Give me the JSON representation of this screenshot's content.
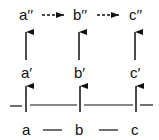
{
  "diagram": {
    "top_row": {
      "nodes": [
        {
          "id": "a2",
          "label": "a′′"
        },
        {
          "id": "b2",
          "label": "b′′"
        },
        {
          "id": "c2",
          "label": "c′′"
        }
      ],
      "edges": [
        {
          "from": "a2",
          "to": "b2",
          "style": "dashed-arrow"
        },
        {
          "from": "b2",
          "to": "c2",
          "style": "dashed-arrow"
        }
      ]
    },
    "middle_row": {
      "nodes": [
        {
          "id": "a1",
          "label": "a′"
        },
        {
          "id": "b1",
          "label": "b′"
        },
        {
          "id": "c1",
          "label": "c′"
        }
      ]
    },
    "bottom_row": {
      "nodes": [
        {
          "id": "a",
          "label": "a"
        },
        {
          "id": "b",
          "label": "b"
        },
        {
          "id": "c",
          "label": "c"
        }
      ],
      "edges": [
        {
          "from": "a",
          "to": "b",
          "style": "line"
        },
        {
          "from": "b",
          "to": "c",
          "style": "line"
        }
      ]
    },
    "vertical_edges": [
      {
        "from": "a1",
        "to": "a2",
        "style": "solid-arrow"
      },
      {
        "from": "b1",
        "to": "b2",
        "style": "solid-arrow"
      },
      {
        "from": "c1",
        "to": "c2",
        "style": "solid-arrow"
      },
      {
        "from": "baseline",
        "to": "a1",
        "style": "solid-arrow"
      },
      {
        "from": "baseline",
        "to": "b1",
        "style": "solid-arrow"
      },
      {
        "from": "baseline",
        "to": "c1",
        "style": "solid-arrow"
      }
    ],
    "colors": {
      "stroke": "#111111",
      "background": "#ffffff"
    }
  }
}
